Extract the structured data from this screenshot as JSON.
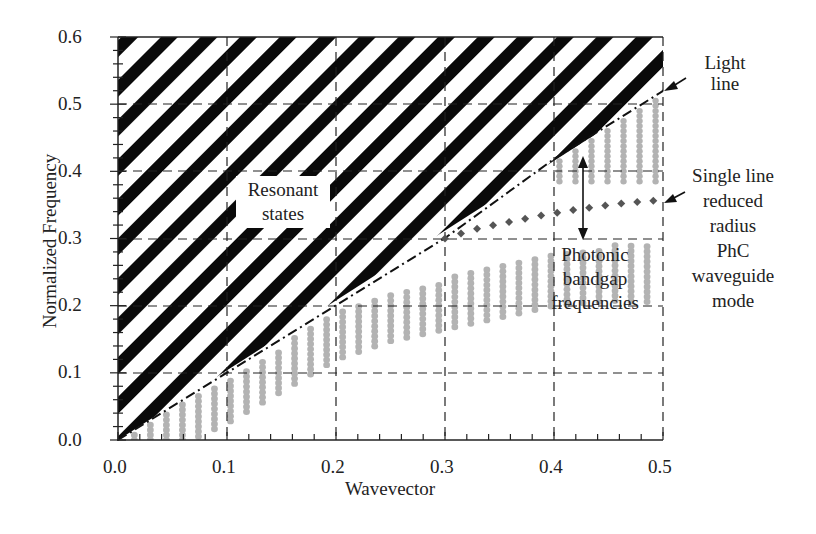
{
  "chart_data": {
    "type": "scatter",
    "title": "",
    "xlabel": "Wavevector",
    "ylabel": "Normalized Frequency",
    "xlim": [
      0.0,
      0.5
    ],
    "ylim": [
      0.0,
      0.6
    ],
    "xticks": [
      "0.0",
      "0.1",
      "0.2",
      "0.3",
      "0.4",
      "0.5"
    ],
    "yticks": [
      "0.0",
      "0.1",
      "0.2",
      "0.3",
      "0.4",
      "0.5",
      "0.6"
    ],
    "grid": "dashed",
    "regions": [
      {
        "name": "Resonant states",
        "style": "black diagonal hatch",
        "description": "above light line",
        "boundary": "light line f = k (reaching ~0.52 at k=0.5)"
      }
    ],
    "series": [
      {
        "name": "Light line",
        "style": "dash-dot black",
        "x": [
          0.0,
          0.1,
          0.2,
          0.3,
          0.4,
          0.5
        ],
        "y": [
          0.0,
          0.1,
          0.2,
          0.3,
          0.42,
          0.52
        ]
      },
      {
        "name": "Single line reduced radius PhC waveguide mode",
        "style": "dark gray diamonds",
        "x": [
          0.3,
          0.33,
          0.36,
          0.39,
          0.42,
          0.45,
          0.48,
          0.5
        ],
        "y": [
          0.3,
          0.315,
          0.325,
          0.335,
          0.343,
          0.35,
          0.355,
          0.357
        ]
      },
      {
        "name": "Photonic band (lower)",
        "style": "light gray dots",
        "x": [
          0.05,
          0.1,
          0.15,
          0.2,
          0.25,
          0.3,
          0.35,
          0.4,
          0.45,
          0.5
        ],
        "y_top": [
          0.05,
          0.09,
          0.14,
          0.19,
          0.22,
          0.24,
          0.26,
          0.28,
          0.29,
          0.29
        ]
      },
      {
        "name": "Photonic band (upper)",
        "style": "light gray dots",
        "x": [
          0.4,
          0.45,
          0.5
        ],
        "y_bottom": [
          0.39,
          0.39,
          0.39
        ],
        "y_top": [
          0.42,
          0.47,
          0.52
        ]
      }
    ],
    "annotations": [
      {
        "text": "Resonant states",
        "x": 0.19,
        "y": 0.37
      },
      {
        "text": "Light line",
        "arrow_to": [
          0.5,
          0.52
        ]
      },
      {
        "text": "Single line reduced radius PhC waveguide mode",
        "arrow_to": [
          0.5,
          0.357
        ]
      },
      {
        "text": "Photonic bandgap frequencies",
        "arrow_span": [
          0.3,
          0.42
        ],
        "x": 0.42
      }
    ]
  },
  "labels": {
    "y_title": "Normalized Frequency",
    "x_title": "Wavevector",
    "resonant_1": "Resonant",
    "resonant_2": "states",
    "light_1": "Light",
    "light_2": "line",
    "wg_1": "Single line",
    "wg_2": "reduced",
    "wg_3": "radius",
    "wg_4": "PhC",
    "wg_5": "waveguide",
    "wg_6": "mode",
    "pbg_1": "Photonic",
    "pbg_2": "bandgap",
    "pbg_3": "frequencies",
    "xt0": "0.0",
    "xt1": "0.1",
    "xt2": "0.2",
    "xt3": "0.3",
    "xt4": "0.4",
    "xt5": "0.5",
    "yt0": "0.0",
    "yt1": "0.1",
    "yt2": "0.2",
    "yt3": "0.3",
    "yt4": "0.4",
    "yt5": "0.5",
    "yt6": "0.6"
  }
}
